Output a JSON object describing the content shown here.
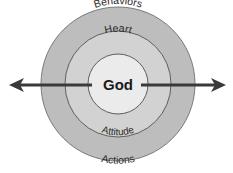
{
  "diagram": {
    "center": {
      "x": 118,
      "y": 84
    },
    "rings": [
      {
        "id": "outer",
        "radius": 77,
        "fill": "#bdbdbd",
        "stroke": "#7a7a7a",
        "top_label": "Behaviors",
        "bottom_label": "Actions"
      },
      {
        "id": "middle",
        "radius": 53,
        "fill": "#d2d2d2",
        "stroke": "#6e6e6e",
        "top_label": "Heart",
        "bottom_label": "Attitude"
      },
      {
        "id": "inner",
        "radius": 30,
        "fill": "#ebebeb",
        "stroke": "#6e6e6e",
        "label": "God"
      }
    ],
    "arrow": {
      "color": "#3a3a3a",
      "y": 85,
      "left_tip_x": 9,
      "left_end_x": 92,
      "right_start_x": 141,
      "right_tip_x": 226,
      "direction": "bidirectional"
    },
    "labels": {
      "outer_top": "Behaviors",
      "middle_top": "Heart",
      "center": "God",
      "middle_bottom": "Attitude",
      "outer_bottom": "Actions"
    }
  }
}
